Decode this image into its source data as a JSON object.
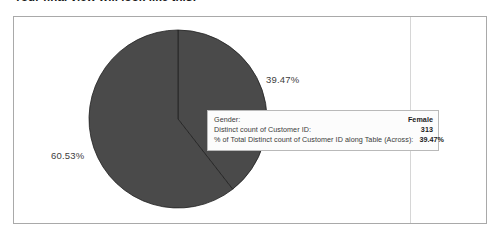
{
  "doc": {
    "heading": "Your final view will look like this:"
  },
  "chart_data": {
    "type": "pie",
    "title": "",
    "field": "Gender",
    "measure": "Distinct count of Customer ID",
    "categories": [
      "Female",
      "Male"
    ],
    "values": [
      39.47,
      60.53
    ],
    "value_unit": "%",
    "counts": [
      313,
      480
    ],
    "labels": [
      "39.47%",
      "60.53%"
    ],
    "colors": [
      "#4a4a4a",
      "#4a4a4a"
    ],
    "slice_border_color": "#222222",
    "legend": "none",
    "grid": false,
    "start_angle_deg": 0,
    "direction": "clockwise"
  },
  "tooltip": {
    "rows": [
      {
        "key": "Gender:",
        "value": "Female"
      },
      {
        "key": "Distinct count of Customer ID:",
        "value": "313"
      },
      {
        "key": "% of Total Distinct count of Customer ID along Table (Across):",
        "value": "39.47%"
      }
    ]
  }
}
